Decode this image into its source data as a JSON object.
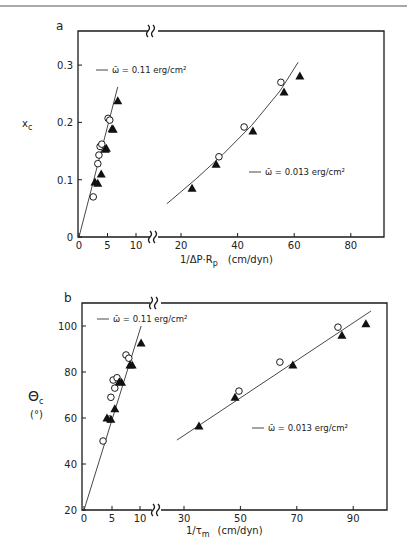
{
  "chart_data": [
    {
      "panel": "a",
      "type": "scatter",
      "title": "",
      "xlabel": "1/ΔP·R_p (cm/dyn)",
      "ylabel": "x_c",
      "x_ticks": [
        "0",
        "5",
        "10",
        "20",
        "40",
        "60",
        "80"
      ],
      "y_ticks": [
        "0",
        "0.1",
        "0.2",
        "0.3"
      ],
      "x_axis_break": [
        11,
        17
      ],
      "ylim": [
        0,
        0.36
      ],
      "grid": false,
      "legend_position": "inline",
      "series": [
        {
          "name": "ω̄ = 0.11 erg/cm²",
          "fit_line": [
            [
              0,
              0
            ],
            [
              6.8,
              0.262
            ]
          ],
          "open_circles": [
            [
              2.5,
              0.07
            ],
            [
              3.3,
              0.128
            ],
            [
              3.5,
              0.143
            ],
            [
              3.7,
              0.158
            ],
            [
              4.0,
              0.162
            ],
            [
              5.1,
              0.207
            ],
            [
              5.4,
              0.204
            ]
          ],
          "filled_triangles": [
            [
              2.8,
              0.096
            ],
            [
              3.3,
              0.094
            ],
            [
              3.9,
              0.11
            ],
            [
              4.6,
              0.153
            ],
            [
              4.8,
              0.155
            ],
            [
              5.8,
              0.189
            ],
            [
              6.0,
              0.188
            ],
            [
              6.8,
              0.238
            ]
          ]
        },
        {
          "name": "ω̄ = 0.013 erg/cm²",
          "fit_line": [
            [
              15,
              0.058
            ],
            [
              25,
              0.1
            ],
            [
              35,
              0.145
            ],
            [
              45,
              0.195
            ],
            [
              55,
              0.255
            ],
            [
              61.4,
              0.305
            ]
          ],
          "open_circles": [
            [
              33.4,
              0.14
            ],
            [
              42.3,
              0.192
            ],
            [
              55.3,
              0.27
            ]
          ],
          "filled_triangles": [
            [
              23.9,
              0.085
            ],
            [
              32.4,
              0.127
            ],
            [
              45.4,
              0.185
            ],
            [
              56.4,
              0.253
            ],
            [
              62.0,
              0.281
            ]
          ]
        }
      ]
    },
    {
      "panel": "b",
      "type": "scatter",
      "title": "",
      "xlabel": "1/τ_m (cm/dyn)",
      "ylabel": "Θ_c (°)",
      "x_ticks": [
        "0",
        "5",
        "10",
        "30",
        "50",
        "70",
        "90"
      ],
      "y_ticks": [
        "20",
        "40",
        "60",
        "80",
        "100"
      ],
      "x_axis_break": [
        11,
        27
      ],
      "ylim": [
        20,
        110
      ],
      "grid": false,
      "legend_position": "inline",
      "series": [
        {
          "name": "ω̄ = 0.11 erg/cm²",
          "fit_line": [
            [
              0,
              20
            ],
            [
              10.2,
              100
            ]
          ],
          "open_circles": [
            [
              3.4,
              50
            ],
            [
              4.5,
              59.5
            ],
            [
              4.8,
              69
            ],
            [
              5.5,
              73
            ],
            [
              5.2,
              76.5
            ],
            [
              5.9,
              77.5
            ],
            [
              7.5,
              87.4
            ],
            [
              8.0,
              86
            ]
          ],
          "filled_triangles": [
            [
              4.1,
              60
            ],
            [
              4.8,
              59.5
            ],
            [
              5.5,
              64
            ],
            [
              6.3,
              75.8
            ],
            [
              6.7,
              75.5
            ],
            [
              8.2,
              83
            ],
            [
              8.6,
              83
            ],
            [
              10.2,
              92.6
            ]
          ]
        },
        {
          "name": "ω̄ = 0.013 erg/cm²",
          "fit_line": [
            [
              27.5,
              50.4
            ],
            [
              96.3,
              106.5
            ]
          ],
          "open_circles": [
            [
              49.5,
              71.7
            ],
            [
              64,
              84.3
            ],
            [
              84.6,
              99.5
            ]
          ],
          "filled_triangles": [
            [
              35.3,
              56.5
            ],
            [
              48.1,
              69
            ],
            [
              68.6,
              83
            ],
            [
              86,
              96
            ],
            [
              94.5,
              101
            ]
          ]
        }
      ]
    }
  ],
  "figure": {
    "panel_a_label": "a",
    "panel_b_label": "b",
    "a_ylabel_main": "x",
    "a_ylabel_sub": "c",
    "a_xlabel": "1/ΔP·R",
    "a_xlabel_sub": "p",
    "a_xlabel_units": "(cm/dyn)",
    "a_legend_1": "ω̄ = 0.11 erg/cm²",
    "a_legend_2": "ω̄ = 0.013 erg/cm²",
    "b_ylabel_main": "Θ",
    "b_ylabel_sub": "c",
    "b_ylabel_units": "(°)",
    "b_xlabel": "1/τ",
    "b_xlabel_sub": "m",
    "b_xlabel_units": "(cm/dyn)",
    "b_legend_1": "ω̄ = 0.11 erg/cm²",
    "b_legend_2": "ω̄ = 0.013 erg/cm²"
  }
}
